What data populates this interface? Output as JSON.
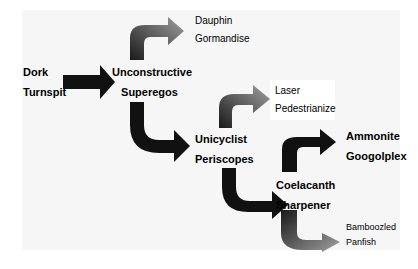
{
  "diagram": {
    "type": "tree-flow",
    "nodes": {
      "root": {
        "line1": "Dork",
        "line2": "Turnspit"
      },
      "n1": {
        "line1": "Unconstructive",
        "line2": "Superegos"
      },
      "n1a": {
        "line1": "Dauphin",
        "line2": "Gormandise"
      },
      "n2": {
        "line1": "Unicyclist",
        "line2": "Periscopes"
      },
      "n2a": {
        "line1": "Laser",
        "line2": "Pedestrianize"
      },
      "n3": {
        "line1": "Coelacanth",
        "line2": "Sharpener"
      },
      "n3a": {
        "line1": "Ammonite",
        "line2": "Googolplex"
      },
      "n3b": {
        "line1": "Bamboozled",
        "line2": "Panfish"
      }
    },
    "edges": [
      [
        "root",
        "n1"
      ],
      [
        "n1",
        "n1a"
      ],
      [
        "n1",
        "n2"
      ],
      [
        "n2",
        "n2a"
      ],
      [
        "n2",
        "n3"
      ],
      [
        "n3",
        "n3a"
      ],
      [
        "n3",
        "n3b"
      ]
    ],
    "colors": {
      "dark": "#111111",
      "gradient_start": "#1a1a1a",
      "gradient_end": "#9a9a9a",
      "panel": "#f6f6f6"
    }
  }
}
